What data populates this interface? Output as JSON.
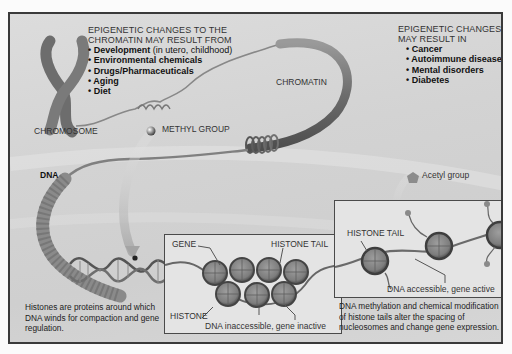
{
  "diagram": {
    "causes": {
      "heading_line1": "EPIGENETIC CHANGES TO THE",
      "heading_line2": "CHROMATIN MAY RESULT FROM",
      "items": [
        {
          "bold": "Development",
          "rest": " (in utero, childhood)"
        },
        {
          "bold": "Environmental chemicals",
          "rest": ""
        },
        {
          "bold": "Drugs/Pharmaceuticals",
          "rest": ""
        },
        {
          "bold": "Aging",
          "rest": ""
        },
        {
          "bold": "Diet",
          "rest": ""
        }
      ]
    },
    "effects": {
      "heading_line1": "EPIGENETIC CHANGES",
      "heading_line2": "MAY RESULT IN",
      "items": [
        "Cancer",
        "Autoimmune disease",
        "Mental disorders",
        "Diabetes"
      ]
    },
    "labels": {
      "chromosome": "CHROMOSOME",
      "chromatin": "CHROMATIN",
      "methyl_group": "METHYL GROUP",
      "acetyl_group": "Acetyl group",
      "dna": "DNA",
      "gene": "GENE",
      "histone_tail_left": "HISTONE TAIL",
      "histone": "HISTONE",
      "dna_inaccessible": "DNA inaccessible, gene inactive",
      "histone_tail_right": "HISTONE TAIL",
      "dna_accessible": "DNA accessible, gene active"
    },
    "captions": {
      "histones": "Histones are proteins around which DNA winds for compaction and gene regulation.",
      "methylation": "DNA methylation and chemical modification of histone tails alter the spacing of nucleosomes and change gene expression."
    },
    "colors": {
      "background": "#d4d4d4",
      "frame_border": "#3a3a3a",
      "structure_dark": "#6a6a6a",
      "structure_mid": "#8c8c8c",
      "inset_box": "#e4e4e4"
    }
  }
}
